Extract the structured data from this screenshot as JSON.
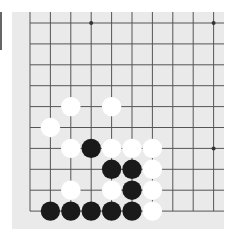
{
  "board": {
    "grid": {
      "x0": 30,
      "y0": 23,
      "dx": 20.4,
      "dy": 20.9,
      "cols": 10,
      "rows": 10
    },
    "colors": {
      "background": "#eaeaea",
      "line": "#555555",
      "black": "#1a1a1a",
      "white": "#ffffff"
    },
    "star_points": [
      [
        3,
        0
      ],
      [
        9,
        0
      ],
      [
        9,
        6
      ]
    ],
    "stones": [
      {
        "c": 2,
        "r": 4,
        "color": "white"
      },
      {
        "c": 4,
        "r": 4,
        "color": "white"
      },
      {
        "c": 1,
        "r": 5,
        "color": "white"
      },
      {
        "c": 2,
        "r": 6,
        "color": "white"
      },
      {
        "c": 3,
        "r": 6,
        "color": "black"
      },
      {
        "c": 4,
        "r": 6,
        "color": "white"
      },
      {
        "c": 5,
        "r": 6,
        "color": "white"
      },
      {
        "c": 6,
        "r": 6,
        "color": "white"
      },
      {
        "c": 4,
        "r": 7,
        "color": "black"
      },
      {
        "c": 5,
        "r": 7,
        "color": "black"
      },
      {
        "c": 6,
        "r": 7,
        "color": "white"
      },
      {
        "c": 2,
        "r": 8,
        "color": "white"
      },
      {
        "c": 4,
        "r": 8,
        "color": "white"
      },
      {
        "c": 5,
        "r": 8,
        "color": "black"
      },
      {
        "c": 6,
        "r": 8,
        "color": "white"
      },
      {
        "c": 1,
        "r": 9,
        "color": "black"
      },
      {
        "c": 2,
        "r": 9,
        "color": "black"
      },
      {
        "c": 3,
        "r": 9,
        "color": "black"
      },
      {
        "c": 4,
        "r": 9,
        "color": "black"
      },
      {
        "c": 5,
        "r": 9,
        "color": "black"
      },
      {
        "c": 6,
        "r": 9,
        "color": "white"
      }
    ]
  }
}
